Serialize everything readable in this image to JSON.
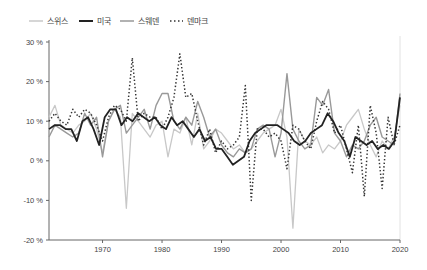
{
  "chart_data": {
    "type": "line",
    "title": "",
    "xlabel": "",
    "ylabel": "",
    "x_start": 1961,
    "x_end": 2020,
    "xlim": [
      1961,
      2020
    ],
    "ylim": [
      -20,
      30
    ],
    "x_ticks": [
      1970,
      1980,
      1990,
      2000,
      2010,
      2020
    ],
    "x_tick_labels": [
      "1970",
      "1980",
      "1990",
      "2000",
      "2010",
      "2020"
    ],
    "y_ticks": [
      30,
      20,
      10,
      0,
      -10,
      -20
    ],
    "y_tick_labels": [
      "30 %",
      "20 %",
      "10 %",
      "0 %",
      "-10 %",
      "-20 %"
    ],
    "grid": false,
    "legend_position": "top-left",
    "legend": [
      "스위스",
      "미국",
      "스웨덴",
      "덴마크"
    ],
    "series": [
      {
        "name": "스위스",
        "color": "#c8c8c8",
        "style": "solid",
        "values": [
          11,
          14,
          9,
          8,
          7,
          9,
          10,
          12,
          8,
          2,
          10,
          13,
          11,
          -12,
          12,
          10,
          8,
          6,
          9,
          10,
          1,
          8,
          7,
          11,
          4,
          12,
          3,
          5,
          8,
          7,
          5,
          3,
          4,
          2,
          3,
          5,
          7,
          8,
          9,
          13,
          6,
          -17,
          8,
          5,
          4,
          6,
          2,
          4,
          3,
          5,
          9,
          11,
          13,
          8,
          4,
          1,
          5,
          3,
          6,
          14
        ]
      },
      {
        "name": "미국",
        "color": "#222222",
        "style": "solid",
        "values": [
          8,
          9,
          9,
          8,
          8,
          5,
          10,
          11,
          8,
          4,
          11,
          13,
          13,
          9,
          11,
          10,
          12,
          11,
          10,
          11,
          9,
          8,
          11,
          9,
          10,
          8,
          6,
          8,
          5,
          6,
          3,
          3,
          1,
          -1,
          0,
          1,
          5,
          7,
          8,
          9,
          9,
          9,
          8,
          7,
          5,
          4,
          5,
          7,
          8,
          9,
          12,
          10,
          7,
          5,
          1,
          6,
          5,
          4,
          5,
          3,
          4,
          3,
          5,
          16
        ]
      },
      {
        "name": "스웨덴",
        "color": "#999999",
        "style": "solid",
        "values": [
          6,
          9,
          8,
          7,
          6,
          7,
          12,
          9,
          11,
          1,
          10,
          13,
          14,
          7,
          9,
          11,
          13,
          8,
          14,
          17,
          17,
          10,
          8,
          11,
          9,
          15,
          11,
          6,
          8,
          4,
          2,
          1,
          3,
          2,
          3,
          8,
          9,
          8,
          1,
          7,
          22,
          8,
          5,
          3,
          4,
          16,
          14,
          18,
          7,
          5,
          1,
          4,
          3,
          5,
          9,
          11,
          6,
          5,
          4,
          17
        ]
      },
      {
        "name": "덴마크",
        "color": "#333333",
        "style": "dotted",
        "values": [
          10,
          12,
          10,
          9,
          13,
          11,
          13,
          12,
          9,
          5,
          11,
          14,
          13,
          10,
          26,
          10,
          12,
          11,
          11,
          8,
          11,
          16,
          27,
          16,
          17,
          10,
          4,
          8,
          2,
          5,
          3,
          4,
          6,
          19,
          -10,
          8,
          8,
          6,
          7,
          5,
          -2,
          9,
          8,
          5,
          3,
          10,
          15,
          13,
          7,
          9,
          3,
          -3,
          9,
          -9,
          14,
          7,
          -7,
          11,
          4,
          9
        ]
      }
    ]
  }
}
